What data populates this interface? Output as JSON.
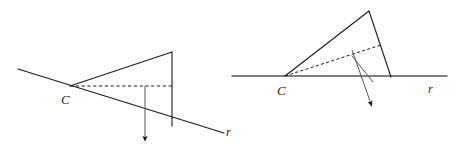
{
  "figure": {
    "stroke_color": "#1a1a1a",
    "background_color": "#ffffff",
    "label_color": "#1a1a1a",
    "diagrams": [
      {
        "id": "left-diagram",
        "name": "oblique-view",
        "labels": {
          "apex": "C",
          "line": "r"
        },
        "elements": {
          "line_r": {
            "name": "line-r",
            "x1": 18,
            "y1": 69,
            "x2": 224,
            "y2": 133,
            "style": "solid"
          },
          "apex_point": {
            "x": 70,
            "y": 86
          },
          "upper_edge": {
            "name": "upper-edge",
            "x1": 70,
            "y1": 86,
            "x2": 172,
            "y2": 52,
            "style": "solid"
          },
          "vertical_edge": {
            "name": "vertical-edge",
            "x1": 172,
            "y1": 52,
            "x2": 172,
            "y2": 126,
            "style": "solid"
          },
          "dashed_axis": {
            "name": "dashed-axis",
            "x1": 70,
            "y1": 86,
            "x2": 172,
            "y2": 86,
            "style": "dashed"
          },
          "arrow_vector": {
            "name": "arrow-vector",
            "x1": 145,
            "y1": 86,
            "x2": 145,
            "y2": 143,
            "style": "solid-arrow"
          },
          "apex_label_pos": {
            "x": 61,
            "y": 104
          },
          "line_label_pos": {
            "x": 226,
            "y": 136
          }
        }
      },
      {
        "id": "right-diagram",
        "name": "tilted-view",
        "labels": {
          "apex": "C",
          "line": "r"
        },
        "elements": {
          "line_r": {
            "name": "line-r",
            "x1": 232,
            "y1": 76,
            "x2": 447,
            "y2": 76,
            "style": "solid"
          },
          "apex_point": {
            "x": 285,
            "y": 76
          },
          "upper_edge": {
            "name": "upper-edge",
            "x1": 285,
            "y1": 76,
            "x2": 369,
            "y2": 11,
            "style": "solid"
          },
          "slant_edge": {
            "name": "slant-edge",
            "x1": 369,
            "y1": 11,
            "x2": 391,
            "y2": 77,
            "style": "solid"
          },
          "dashed_axis": {
            "name": "dashed-axis",
            "x1": 285,
            "y1": 76,
            "x2": 381,
            "y2": 45,
            "style": "dashed"
          },
          "base_edge": {
            "name": "base-edge",
            "x1": 352,
            "y1": 56,
            "x2": 373,
            "y2": 82,
            "style": "solid"
          },
          "arrow_vector": {
            "name": "arrow-vector",
            "x1": 352,
            "y1": 50,
            "x2": 372,
            "y2": 107,
            "style": "solid-arrow"
          },
          "apex_label_pos": {
            "x": 277,
            "y": 94
          },
          "line_label_pos": {
            "x": 428,
            "y": 93
          }
        }
      }
    ]
  }
}
